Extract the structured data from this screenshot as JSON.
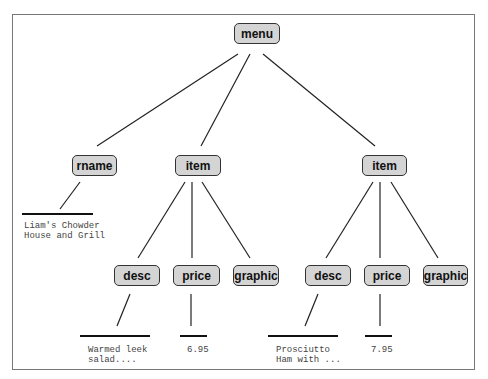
{
  "diagram": {
    "nodes": [
      {
        "id": "menu",
        "label": "menu",
        "x": 234,
        "y": 23,
        "w": 46
      },
      {
        "id": "rname",
        "label": "rname",
        "x": 72,
        "y": 155,
        "w": 45
      },
      {
        "id": "item1",
        "label": "item",
        "x": 175,
        "y": 155,
        "w": 46
      },
      {
        "id": "item2",
        "label": "item",
        "x": 362,
        "y": 155,
        "w": 45
      },
      {
        "id": "desc1",
        "label": "desc",
        "x": 114,
        "y": 265,
        "w": 46
      },
      {
        "id": "price1",
        "label": "price",
        "x": 173,
        "y": 265,
        "w": 47
      },
      {
        "id": "graphic1",
        "label": "graphic",
        "x": 233,
        "y": 265,
        "w": 46
      },
      {
        "id": "desc2",
        "label": "desc",
        "x": 305,
        "y": 265,
        "w": 46
      },
      {
        "id": "price2",
        "label": "price",
        "x": 364,
        "y": 265,
        "w": 46
      },
      {
        "id": "graphic2",
        "label": "graphic",
        "x": 423,
        "y": 265,
        "w": 45
      }
    ],
    "leaves": [
      {
        "id": "rname-text",
        "parent": "rname",
        "lines": [
          "Liam's Chowder",
          "House and Grill"
        ],
        "x": 24,
        "y": 221
      },
      {
        "id": "desc1-text",
        "parent": "desc1",
        "lines": [
          "Warmed leek",
          "salad...."
        ],
        "x": 88,
        "y": 345
      },
      {
        "id": "price1-text",
        "parent": "price1",
        "lines": [
          "6.95"
        ],
        "x": 187,
        "y": 345
      },
      {
        "id": "desc2-text",
        "parent": "desc2",
        "lines": [
          "Prosciutto",
          "Ham with ..."
        ],
        "x": 276,
        "y": 345
      },
      {
        "id": "price2-text",
        "parent": "price2",
        "lines": [
          "7.95"
        ],
        "x": 371,
        "y": 345
      }
    ],
    "edges": [
      [
        238,
        54,
        97,
        146
      ],
      [
        250,
        54,
        201,
        146
      ],
      [
        263,
        54,
        375,
        146
      ],
      [
        80,
        182,
        60,
        209
      ],
      [
        185,
        182,
        138,
        258
      ],
      [
        192,
        182,
        192,
        258
      ],
      [
        202,
        182,
        250,
        258
      ],
      [
        373,
        182,
        326,
        258
      ],
      [
        380,
        182,
        380,
        258
      ],
      [
        391,
        182,
        438,
        258
      ],
      [
        130,
        294,
        117,
        326
      ],
      [
        191,
        294,
        191,
        326
      ],
      [
        318,
        294,
        305,
        326
      ],
      [
        380,
        294,
        380,
        326
      ]
    ],
    "bars": [
      [
        22,
        214,
        93,
        214
      ],
      [
        80,
        336,
        150,
        336
      ],
      [
        180,
        336,
        207,
        336
      ],
      [
        268,
        336,
        338,
        336
      ],
      [
        365,
        336,
        392,
        336
      ]
    ]
  }
}
